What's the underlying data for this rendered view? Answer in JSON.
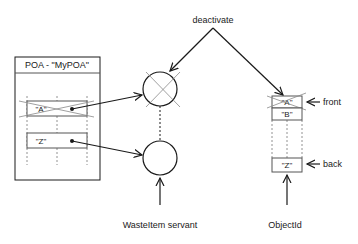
{
  "diagram": {
    "type": "object-deactivation",
    "poa": {
      "title": "POA - \"MyPOA\"",
      "entries": [
        {
          "key": "\"A\"",
          "crossed_out": true
        },
        {
          "key": "\"Z\"",
          "crossed_out": false
        }
      ]
    },
    "servants": [
      {
        "id": "servant-top",
        "crossed_out": true
      },
      {
        "id": "servant-bottom",
        "crossed_out": false
      }
    ],
    "servant_label": "WasteItem servant",
    "queue": {
      "entries": [
        {
          "key": "\"A\"",
          "crossed_out": true
        },
        {
          "key": "\"B\"",
          "crossed_out": false
        },
        {
          "key": "\"Z\"",
          "crossed_out": false
        }
      ],
      "front_label": "front",
      "back_label": "back"
    },
    "objectid_label": "ObjectId",
    "action_label": "deactivate",
    "colors": {
      "line": "#1a1a1a",
      "cross": "#888888",
      "box_border": "#555555"
    }
  }
}
